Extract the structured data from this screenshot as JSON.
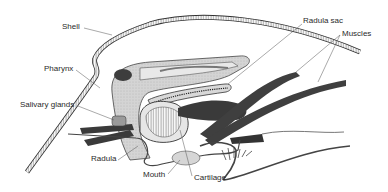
{
  "figure": {
    "labels": {
      "shell": "Shell",
      "pharynx": "Pharynx",
      "salivary_glands": "Salivary glands",
      "radula": "Radula",
      "mouth": "Mouth",
      "cartilage": "Cartilage",
      "radula_sac": "Radula sac",
      "muscles": "Muscles"
    },
    "colors": {
      "ink": "#2a2a2a",
      "tissue_fill": "#cfcfcf",
      "muscle_fill": "#3a3a3a",
      "background": "#ffffff"
    }
  }
}
